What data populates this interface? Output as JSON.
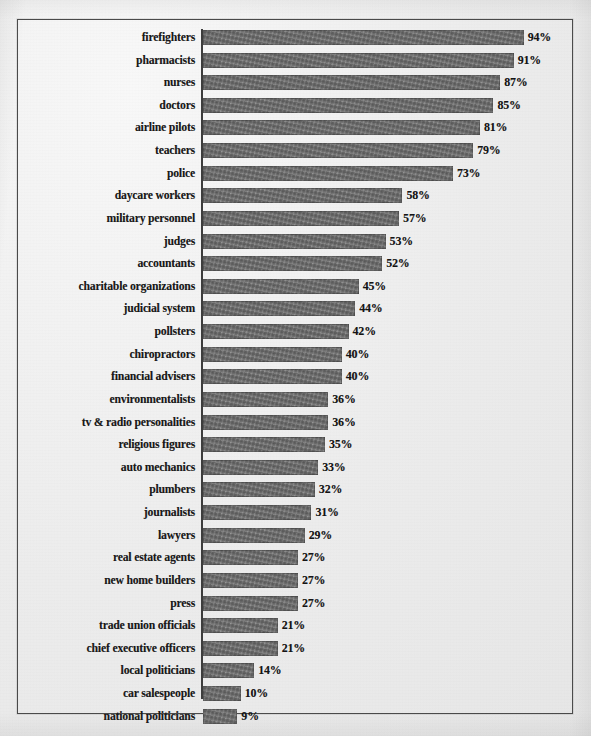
{
  "document": {
    "kind": "scanned-bar-chart",
    "frame_color": "#4a4a4a",
    "paper_color": "#f1f1f1",
    "bar_color": "#6d6d6d",
    "text_color": "#191919"
  },
  "chart_data": {
    "type": "bar",
    "orientation": "horizontal",
    "title": "",
    "subtitle": "",
    "xlabel": "",
    "ylabel": "",
    "xlim": [
      0,
      100
    ],
    "grid": false,
    "legend": null,
    "value_suffix": "%",
    "categories": [
      "firefighters",
      "pharmacists",
      "nurses",
      "doctors",
      "airline pilots",
      "teachers",
      "police",
      "daycare workers",
      "military personnel",
      "judges",
      "accountants",
      "charitable organizations",
      "judicial system",
      "pollsters",
      "chiropractors",
      "financial advisers",
      "environmentalists",
      "tv & radio personalities",
      "religious figures",
      "auto mechanics",
      "plumbers",
      "journalists",
      "lawyers",
      "real estate agents",
      "new home builders",
      "press",
      "trade union officials",
      "chief executive officers",
      "local politicians",
      "car salespeople",
      "national politicians"
    ],
    "values": [
      94,
      91,
      87,
      85,
      81,
      79,
      73,
      58,
      57,
      53,
      52,
      45,
      44,
      42,
      40,
      40,
      36,
      36,
      35,
      33,
      32,
      31,
      29,
      27,
      27,
      27,
      21,
      21,
      14,
      10,
      9
    ],
    "data_labels": [
      "94%",
      "91%",
      "87%",
      "85%",
      "81%",
      "79%",
      "73%",
      "58%",
      "57%",
      "53%",
      "52%",
      "45%",
      "44%",
      "42%",
      "40%",
      "40%",
      "36%",
      "36%",
      "35%",
      "33%",
      "32%",
      "31%",
      "29%",
      "27%",
      "27%",
      "27%",
      "21%",
      "21%",
      "14%",
      "10%",
      "9%"
    ]
  }
}
